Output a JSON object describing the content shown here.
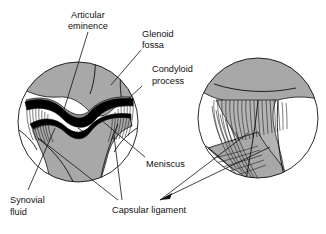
{
  "figure": {
    "background_color": "#ffffff",
    "ink_color": "#111111",
    "bone_fill_color": "#a8a8a8",
    "cartilage_fill_color": "#8c8c8c",
    "meniscus_color": "#000000",
    "canvas": {
      "width": 326,
      "height": 234
    }
  },
  "labels": {
    "articular_eminence": {
      "line1": "Articular",
      "line2": "eminence"
    },
    "glenoid_fossa": {
      "line1": "Glenoid",
      "line2": "fossa"
    },
    "condyloid_process": {
      "line1": "Condyloid",
      "line2": "process"
    },
    "meniscus": {
      "line1": "Meniscus"
    },
    "synovial_fluid": {
      "line1": "Synovial",
      "line2": "fluid"
    },
    "capsular_ligament": {
      "line1": "Capsular ligament"
    }
  },
  "panels": {
    "left": {
      "name": "sagittal-section-view",
      "center_x": 78,
      "center_y": 122,
      "radius": 60
    },
    "right": {
      "name": "lateral-ligament-view",
      "center_x": 258,
      "center_y": 118,
      "radius": 60
    }
  }
}
